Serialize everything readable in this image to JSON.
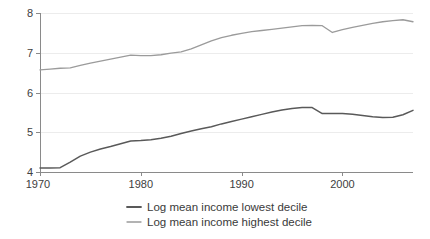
{
  "chart_data": {
    "type": "line",
    "title": "",
    "subtitle": "",
    "xlabel": "",
    "ylabel": "",
    "xlim": [
      1970,
      2007
    ],
    "ylim": [
      4,
      8
    ],
    "grid": true,
    "grid_axis": "y",
    "legend_position": "bottom",
    "x_ticks": [
      1970,
      1980,
      1990,
      2000
    ],
    "x_tick_labels": [
      "1970",
      "1980",
      "1990",
      "2000"
    ],
    "y_ticks": [
      4,
      5,
      6,
      7,
      8
    ],
    "y_tick_labels": [
      "4",
      "5",
      "6",
      "7",
      "8"
    ],
    "x": [
      1970,
      1971,
      1972,
      1973,
      1974,
      1975,
      1976,
      1977,
      1978,
      1979,
      1980,
      1981,
      1982,
      1983,
      1984,
      1985,
      1986,
      1987,
      1988,
      1989,
      1990,
      1991,
      1992,
      1993,
      1994,
      1995,
      1996,
      1997,
      1998,
      1999,
      2000,
      2001,
      2002,
      2003,
      2004,
      2005,
      2006,
      2007
    ],
    "series": [
      {
        "name": "Log mean income lowest decile",
        "color": "#595959",
        "values": [
          4.1,
          4.1,
          4.11,
          4.25,
          4.4,
          4.5,
          4.58,
          4.64,
          4.71,
          4.78,
          4.79,
          4.81,
          4.85,
          4.9,
          4.97,
          5.03,
          5.09,
          5.14,
          5.21,
          5.27,
          5.33,
          5.39,
          5.45,
          5.51,
          5.56,
          5.6,
          5.62,
          5.62,
          5.47,
          5.47,
          5.47,
          5.45,
          5.42,
          5.39,
          5.37,
          5.38,
          5.44,
          5.55
        ]
      },
      {
        "name": "Log mean income highest decile",
        "color": "#9b9b9b",
        "values": [
          6.57,
          6.59,
          6.61,
          6.62,
          6.68,
          6.74,
          6.79,
          6.84,
          6.89,
          6.94,
          6.93,
          6.93,
          6.95,
          6.99,
          7.02,
          7.1,
          7.2,
          7.3,
          7.38,
          7.44,
          7.49,
          7.53,
          7.56,
          7.59,
          7.62,
          7.65,
          7.68,
          7.69,
          7.68,
          7.51,
          7.58,
          7.64,
          7.69,
          7.74,
          7.78,
          7.81,
          7.83,
          7.78
        ]
      }
    ],
    "legend": [
      {
        "label": "Log mean income lowest decile",
        "color": "#595959"
      },
      {
        "label": "Log mean income highest decile",
        "color": "#9b9b9b"
      }
    ],
    "annotations": []
  },
  "axes": {
    "y_axis_name": "value-axis",
    "x_axis_name": "year-axis"
  }
}
